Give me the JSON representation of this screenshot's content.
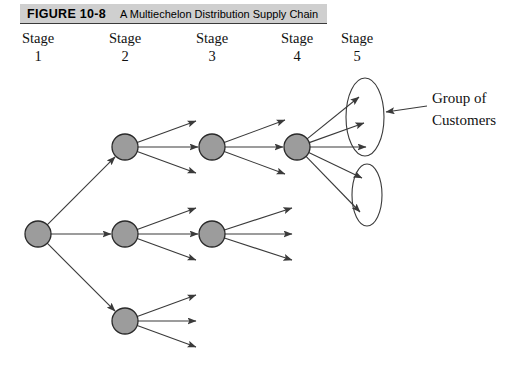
{
  "caption": {
    "figure_number": "FIGURE 10-8",
    "title": "A Multiechelon Distribution Supply Chain",
    "bar_color": "#cfcfcf"
  },
  "stages": [
    {
      "label": "Stage",
      "number": "1",
      "x": 3
    },
    {
      "label": "Stage",
      "number": "2",
      "x": 90
    },
    {
      "label": "Stage",
      "number": "3",
      "x": 177
    },
    {
      "label": "Stage",
      "number": "4",
      "x": 262
    },
    {
      "label": "Stage",
      "number": "5",
      "x": 322
    }
  ],
  "annotation": {
    "line1": "Group of",
    "line2": "Customers"
  },
  "style": {
    "node_fill": "#9c9c9c",
    "node_stroke": "#2a2a2a",
    "edge_color": "#3a3a3a",
    "ellipse_stroke": "#3a3a3a",
    "background": "#ffffff"
  },
  "chart_data": {
    "type": "diagram",
    "title": "A Multiechelon Distribution Supply Chain",
    "node_radius": 13,
    "nodes": [
      {
        "id": "s1",
        "stage": 1,
        "cx": 38,
        "cy": 234
      },
      {
        "id": "s2a",
        "stage": 2,
        "cx": 125,
        "cy": 147
      },
      {
        "id": "s2b",
        "stage": 2,
        "cx": 125,
        "cy": 234
      },
      {
        "id": "s2c",
        "stage": 2,
        "cx": 125,
        "cy": 321
      },
      {
        "id": "s3a",
        "stage": 3,
        "cx": 212,
        "cy": 147
      },
      {
        "id": "s3b",
        "stage": 3,
        "cx": 212,
        "cy": 234
      },
      {
        "id": "s4a",
        "stage": 4,
        "cx": 297,
        "cy": 147
      }
    ],
    "ellipses": [
      {
        "id": "group-top",
        "cx": 365,
        "cy": 117,
        "rx": 19,
        "ry": 39
      },
      {
        "id": "group-bottom",
        "cx": 367,
        "cy": 195,
        "rx": 15,
        "ry": 31
      }
    ],
    "edges": [
      {
        "from": "s1",
        "to": "s2a",
        "type": "node-to-node"
      },
      {
        "from": "s1",
        "to": "s2b",
        "type": "node-to-node"
      },
      {
        "from": "s1",
        "to": "s2c",
        "type": "node-to-node"
      },
      {
        "from": "s2a",
        "to": "s3a",
        "type": "node-to-node"
      },
      {
        "from": "s2a",
        "to": "free",
        "type": "node-to-free",
        "x2": 196,
        "y2": 121
      },
      {
        "from": "s2a",
        "to": "free",
        "type": "node-to-free",
        "x2": 196,
        "y2": 173
      },
      {
        "from": "s2b",
        "to": "s3b",
        "type": "node-to-node"
      },
      {
        "from": "s2b",
        "to": "free",
        "type": "node-to-free",
        "x2": 196,
        "y2": 208
      },
      {
        "from": "s2b",
        "to": "free",
        "type": "node-to-free",
        "x2": 196,
        "y2": 260
      },
      {
        "from": "s2c",
        "to": "free",
        "type": "node-to-free",
        "x2": 196,
        "y2": 295
      },
      {
        "from": "s2c",
        "to": "free",
        "type": "node-to-free",
        "x2": 196,
        "y2": 321
      },
      {
        "from": "s2c",
        "to": "free",
        "type": "node-to-free",
        "x2": 196,
        "y2": 347
      },
      {
        "from": "s3a",
        "to": "s4a",
        "type": "node-to-node"
      },
      {
        "from": "s3a",
        "to": "free",
        "type": "node-to-free",
        "x2": 285,
        "y2": 120
      },
      {
        "from": "s3a",
        "to": "free",
        "type": "node-to-free",
        "x2": 285,
        "y2": 174
      },
      {
        "from": "s3b",
        "to": "free",
        "type": "node-to-free",
        "x2": 292,
        "y2": 208
      },
      {
        "from": "s3b",
        "to": "free",
        "type": "node-to-free",
        "x2": 292,
        "y2": 234
      },
      {
        "from": "s3b",
        "to": "free",
        "type": "node-to-free",
        "x2": 292,
        "y2": 260
      },
      {
        "from": "s4a",
        "to": "group-top",
        "type": "node-to-group",
        "x2": 359,
        "y2": 97
      },
      {
        "from": "s4a",
        "to": "group-top",
        "type": "node-to-group",
        "x2": 364,
        "y2": 123
      },
      {
        "from": "s4a",
        "to": "group-top",
        "type": "node-to-group",
        "x2": 366,
        "y2": 147
      },
      {
        "from": "s4a",
        "to": "group-bottom",
        "type": "node-to-group",
        "x2": 362,
        "y2": 178
      },
      {
        "from": "s4a",
        "to": "group-bottom",
        "type": "node-to-group",
        "x2": 360,
        "y2": 212
      }
    ],
    "annotation_leader": {
      "x1": 427,
      "y1": 106,
      "x2": 386,
      "y2": 112
    }
  }
}
